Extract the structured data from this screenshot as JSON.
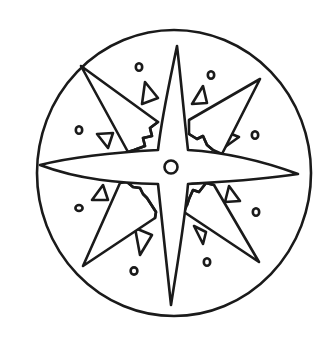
{
  "image": {
    "title": "Compass rose line drawing",
    "description": "Eight-pointed compass star inside a circle with small triangles, jagged inner edges and small dots",
    "colors": {
      "ink": "#1a1a1a",
      "background": "#ffffff"
    }
  },
  "elements": {
    "outer_circle": "outer-circle",
    "cardinal_points": [
      "north",
      "east",
      "south",
      "west"
    ],
    "diagonal_points": [
      "northeast",
      "southeast",
      "southwest",
      "northwest"
    ],
    "center": "center-ring",
    "dot_count": 8,
    "triangle_count": 8
  }
}
